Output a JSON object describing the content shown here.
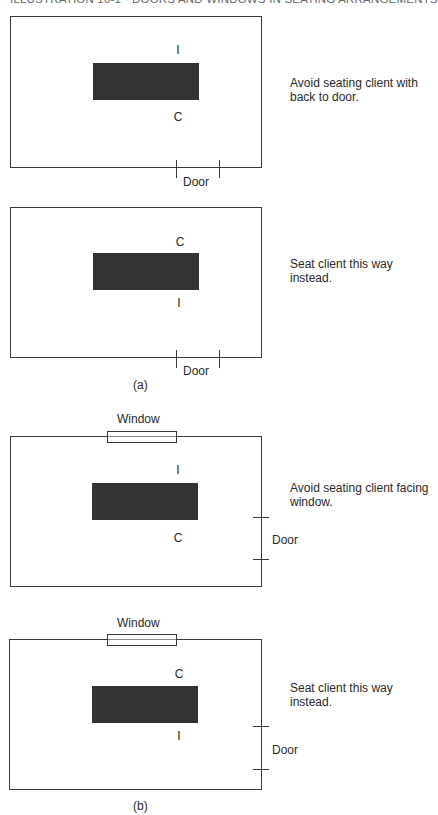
{
  "header": {
    "title": "ILLUSTRATION 10-1 · DOORS AND WINDOWS IN SEATING ARRANGEMENTS"
  },
  "legend": {
    "interviewer": "I",
    "client": "C"
  },
  "panels": [
    {
      "group": "a",
      "seat_top": "I",
      "seat_bottom": "C",
      "door_label": "Door",
      "door_position": "bottom",
      "caption_line1": "Avoid seating client with",
      "caption_line2": "back to door."
    },
    {
      "group": "a",
      "seat_top": "C",
      "seat_bottom": "I",
      "door_label": "Door",
      "door_position": "bottom",
      "caption_line1": "Seat client this way",
      "caption_line2": "instead."
    },
    {
      "group": "b",
      "window_label": "Window",
      "seat_top": "I",
      "seat_bottom": "C",
      "door_label": "Door",
      "door_position": "right",
      "caption_line1": "Avoid seating client facing",
      "caption_line2": "window."
    },
    {
      "group": "b",
      "window_label": "Window",
      "seat_top": "C",
      "seat_bottom": "I",
      "door_label": "Door",
      "door_position": "right",
      "caption_line1": "Seat client this way",
      "caption_line2": "instead."
    }
  ],
  "subfigures": {
    "a": "(a)",
    "b": "(b)"
  },
  "colors": {
    "table": "#333333",
    "lines": "#3a3a3a",
    "text": "#2a2a2a"
  }
}
